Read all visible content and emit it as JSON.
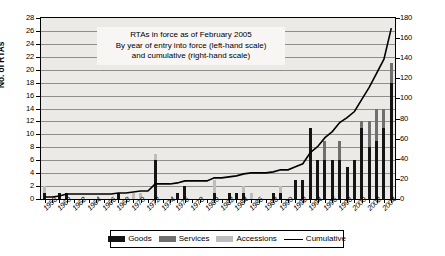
{
  "chart_data": {
    "type": "bar",
    "title": "RTAs in force as of February 2005",
    "subtitle_line2": "By year of entry into force (left-hand scale)",
    "subtitle_line3": "and cumulative (right-hand scale)",
    "xlabel": "",
    "ylabel": "No. of RTAs",
    "ylabel_right": "",
    "ylim": [
      0,
      28
    ],
    "ylim_right": [
      0,
      180
    ],
    "ytick_step": 2,
    "ytick_step_right": 20,
    "yticks": [
      0,
      2,
      4,
      6,
      8,
      10,
      12,
      14,
      16,
      18,
      20,
      22,
      24,
      26,
      28
    ],
    "yticks_right": [
      0,
      20,
      40,
      60,
      80,
      100,
      120,
      140,
      160,
      180
    ],
    "grid": true,
    "legend_position": "bottom",
    "stacked": true,
    "categories": [
      "1958",
      "1959",
      "1960",
      "1961",
      "1962",
      "1963",
      "1964",
      "1965",
      "1966",
      "1967",
      "1968",
      "1969",
      "1970",
      "1971",
      "1972",
      "1973",
      "1974",
      "1975",
      "1976",
      "1977",
      "1978",
      "1979",
      "1980",
      "1981",
      "1982",
      "1983",
      "1984",
      "1985",
      "1986",
      "1987",
      "1988",
      "1989",
      "1990",
      "1991",
      "1992",
      "1993",
      "1994",
      "1995",
      "1996",
      "1997",
      "1998",
      "1999",
      "2000",
      "2001",
      "2002",
      "2003",
      "2004",
      "2005"
    ],
    "xtick_labels": [
      "1958",
      "1960",
      "1962",
      "1964",
      "1966",
      "1968",
      "1970",
      "1972",
      "1974",
      "1976",
      "1978",
      "1980",
      "1982",
      "1984",
      "1986",
      "1988",
      "1990",
      "1992",
      "1994",
      "1996",
      "1998",
      "2000",
      "2002",
      "2004"
    ],
    "series": [
      {
        "name": "Goods",
        "color": "#141414",
        "values": [
          1,
          0,
          1,
          1,
          0,
          0,
          0,
          0,
          0,
          0,
          1,
          0,
          0,
          0,
          0,
          6,
          0,
          0,
          1,
          2,
          0,
          0,
          0,
          1,
          0,
          1,
          1,
          1,
          0,
          0,
          0,
          1,
          1,
          0,
          3,
          3,
          11,
          6,
          6,
          6,
          6,
          5,
          6,
          11,
          8,
          9,
          11,
          18
        ]
      },
      {
        "name": "Services",
        "color": "#6f6f6f",
        "values": [
          0,
          0,
          0,
          0,
          0,
          0,
          0,
          0,
          0,
          0,
          0,
          0,
          0,
          0,
          0,
          0,
          0,
          0,
          0,
          0,
          0,
          0,
          0,
          0,
          0,
          0,
          0,
          0,
          0,
          0,
          0,
          0,
          0,
          0,
          0,
          0,
          0,
          0,
          3,
          0,
          3,
          0,
          0,
          1,
          4,
          5,
          3,
          3
        ]
      },
      {
        "name": "Accessions",
        "color": "#bdbdbd",
        "values": [
          1,
          0,
          0,
          0,
          0,
          0,
          0,
          0,
          0,
          0,
          0,
          0,
          1,
          1,
          0,
          1,
          0,
          0,
          0,
          0,
          0,
          0,
          0,
          2,
          0,
          0,
          0,
          1,
          1,
          0,
          0,
          0,
          1,
          0,
          0,
          0,
          0,
          0,
          0,
          0,
          0,
          0,
          0,
          0,
          0,
          0,
          0,
          0
        ]
      }
    ],
    "cumulative": {
      "name": "Cumulative",
      "color": "#000000",
      "axis": "right",
      "values": [
        2,
        2,
        3,
        5,
        5,
        5,
        5,
        5,
        5,
        5,
        6,
        6,
        7,
        8,
        8,
        15,
        15,
        15,
        16,
        18,
        18,
        18,
        18,
        21,
        21,
        22,
        23,
        25,
        26,
        26,
        26,
        27,
        29,
        29,
        32,
        35,
        46,
        52,
        61,
        67,
        76,
        81,
        87,
        99,
        111,
        125,
        139,
        170
      ]
    }
  },
  "legend": {
    "items": [
      {
        "label": "Goods",
        "type": "swatch",
        "color": "#141414"
      },
      {
        "label": "Services",
        "type": "swatch",
        "color": "#6f6f6f"
      },
      {
        "label": "Accessions",
        "type": "swatch",
        "color": "#bdbdbd"
      },
      {
        "label": "Cumulative",
        "type": "line",
        "color": "#000000"
      }
    ]
  }
}
